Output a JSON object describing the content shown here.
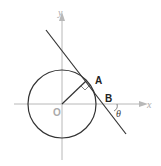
{
  "diagram": {
    "axes": {
      "x_label": "x",
      "y_label": "y",
      "color": "#b0b0b0"
    },
    "origin_label": "O",
    "point_a_label": "A",
    "point_b_label": "B",
    "angle_label": "θ",
    "colors": {
      "stroke": "#333333",
      "axis": "#b0b0b0",
      "label_gray": "#a0a0a0"
    }
  }
}
